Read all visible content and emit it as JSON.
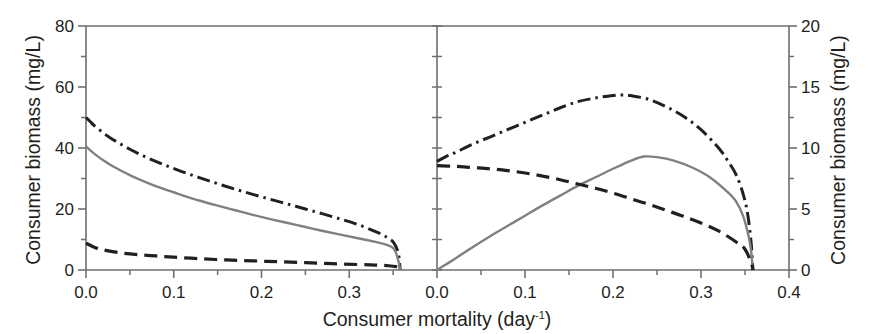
{
  "figure": {
    "xlabel": "Consumer mortality (day",
    "xlabel_sup": "-1",
    "xlabel_tail": ")",
    "left_ylabel": "Consumer biomass (mg/L)",
    "right_ylabel": "Consumer biomass (mg/L)"
  },
  "chart_data": [
    {
      "type": "line",
      "panel": "left",
      "title": "",
      "xlabel": "Consumer mortality (day^-1)",
      "ylabel": "Consumer biomass (mg/L)",
      "xlim": [
        0.0,
        0.4
      ],
      "ylim": [
        0,
        80
      ],
      "xticks": [
        0.0,
        0.1,
        0.2,
        0.3,
        0.4
      ],
      "xtick_labels": [
        "0.0",
        "0.1",
        "0.2",
        "0.3",
        "0.4"
      ],
      "yticks": [
        0,
        20,
        40,
        60,
        80
      ],
      "ytick_labels": [
        "0",
        "20",
        "40",
        "60",
        "80"
      ],
      "yminor_ticks": [
        10,
        30,
        50,
        70
      ],
      "xminor_ticks": [
        0.05,
        0.15,
        0.25,
        0.35
      ],
      "grid": false,
      "legend": "none",
      "series": [
        {
          "name": "dash-dot-curve",
          "style": "dashdot",
          "color": "#231f20",
          "x": [
            0.0,
            0.005,
            0.01,
            0.02,
            0.03,
            0.05,
            0.07,
            0.09,
            0.11,
            0.13,
            0.15,
            0.17,
            0.19,
            0.21,
            0.23,
            0.25,
            0.27,
            0.29,
            0.31,
            0.33,
            0.34,
            0.345,
            0.35,
            0.355,
            0.357,
            0.358
          ],
          "y": [
            50.0,
            48.6,
            47.2,
            44.9,
            42.9,
            39.6,
            36.8,
            34.4,
            32.2,
            30.2,
            28.3,
            26.5,
            24.8,
            23.2,
            21.6,
            20.0,
            18.4,
            16.7,
            14.9,
            12.6,
            11.2,
            10.3,
            9.2,
            6.5,
            3.5,
            0.0
          ]
        },
        {
          "name": "solid-gray-curve",
          "style": "solid",
          "color": "#808080",
          "x": [
            0.0,
            0.005,
            0.01,
            0.02,
            0.03,
            0.05,
            0.07,
            0.09,
            0.11,
            0.13,
            0.15,
            0.17,
            0.19,
            0.21,
            0.23,
            0.25,
            0.27,
            0.29,
            0.31,
            0.33,
            0.34,
            0.345,
            0.35,
            0.353,
            0.356,
            0.358
          ],
          "y": [
            40.5,
            39.2,
            38.0,
            35.9,
            34.1,
            31.1,
            28.6,
            26.4,
            24.5,
            22.7,
            21.1,
            19.6,
            18.1,
            16.7,
            15.4,
            14.1,
            12.8,
            11.6,
            10.4,
            9.2,
            8.5,
            8.0,
            7.2,
            5.8,
            3.0,
            0.0
          ]
        },
        {
          "name": "dashed-curve",
          "style": "dashed",
          "color": "#231f20",
          "x": [
            0.0,
            0.01,
            0.02,
            0.04,
            0.06,
            0.08,
            0.1,
            0.13,
            0.16,
            0.19,
            0.22,
            0.25,
            0.28,
            0.31,
            0.33,
            0.345,
            0.353,
            0.357,
            0.358
          ],
          "y": [
            8.8,
            7.4,
            6.6,
            5.6,
            5.0,
            4.6,
            4.2,
            3.7,
            3.3,
            3.0,
            2.7,
            2.4,
            2.1,
            1.8,
            1.6,
            1.4,
            1.1,
            0.5,
            0.0
          ]
        }
      ]
    },
    {
      "type": "line",
      "panel": "right",
      "title": "",
      "xlabel": "Consumer mortality (day^-1)",
      "ylabel": "Consumer biomass (mg/L)",
      "xlim": [
        0.0,
        0.4
      ],
      "ylim": [
        0,
        20
      ],
      "xticks": [
        0.0,
        0.1,
        0.2,
        0.3,
        0.4
      ],
      "xtick_labels": [
        "0.0",
        "0.1",
        "0.2",
        "0.3",
        "0.4"
      ],
      "yticks": [
        0,
        5,
        10,
        15,
        20
      ],
      "ytick_labels": [
        "0",
        "5",
        "10",
        "15",
        "20"
      ],
      "yminor_ticks": [
        2.5,
        7.5,
        12.5,
        17.5
      ],
      "xminor_ticks": [
        0.05,
        0.15,
        0.25,
        0.35
      ],
      "grid": false,
      "legend": "none",
      "series": [
        {
          "name": "dash-dot-curve",
          "style": "dashdot",
          "color": "#231f20",
          "x": [
            0.0,
            0.01,
            0.02,
            0.04,
            0.06,
            0.08,
            0.1,
            0.12,
            0.14,
            0.16,
            0.18,
            0.2,
            0.21,
            0.22,
            0.24,
            0.26,
            0.28,
            0.3,
            0.32,
            0.33,
            0.34,
            0.348,
            0.353,
            0.357,
            0.359
          ],
          "y": [
            8.9,
            9.3,
            9.6,
            10.3,
            10.9,
            11.5,
            12.1,
            12.7,
            13.3,
            13.8,
            14.1,
            14.3,
            14.35,
            14.3,
            14.0,
            13.4,
            12.6,
            11.5,
            10.0,
            9.0,
            7.8,
            6.2,
            4.6,
            2.2,
            0.0
          ]
        },
        {
          "name": "solid-gray-curve",
          "style": "solid",
          "color": "#808080",
          "x": [
            0.0,
            0.01,
            0.02,
            0.04,
            0.06,
            0.08,
            0.1,
            0.12,
            0.14,
            0.16,
            0.18,
            0.2,
            0.22,
            0.235,
            0.25,
            0.27,
            0.29,
            0.31,
            0.33,
            0.34,
            0.348,
            0.354,
            0.357,
            0.359
          ],
          "y": [
            0.0,
            0.45,
            0.9,
            1.85,
            2.75,
            3.6,
            4.45,
            5.3,
            6.1,
            6.9,
            7.6,
            8.3,
            8.95,
            9.3,
            9.25,
            8.95,
            8.4,
            7.6,
            6.4,
            5.6,
            4.4,
            2.8,
            1.5,
            0.0
          ]
        },
        {
          "name": "dashed-curve",
          "style": "dashed",
          "color": "#231f20",
          "x": [
            0.0,
            0.02,
            0.04,
            0.06,
            0.08,
            0.1,
            0.12,
            0.14,
            0.16,
            0.18,
            0.2,
            0.22,
            0.24,
            0.26,
            0.28,
            0.3,
            0.32,
            0.34,
            0.35,
            0.357,
            0.359
          ],
          "y": [
            8.55,
            8.5,
            8.4,
            8.3,
            8.15,
            7.95,
            7.7,
            7.4,
            7.05,
            6.7,
            6.3,
            5.85,
            5.4,
            4.9,
            4.4,
            3.85,
            3.2,
            2.3,
            1.7,
            0.6,
            0.0
          ]
        }
      ]
    }
  ]
}
